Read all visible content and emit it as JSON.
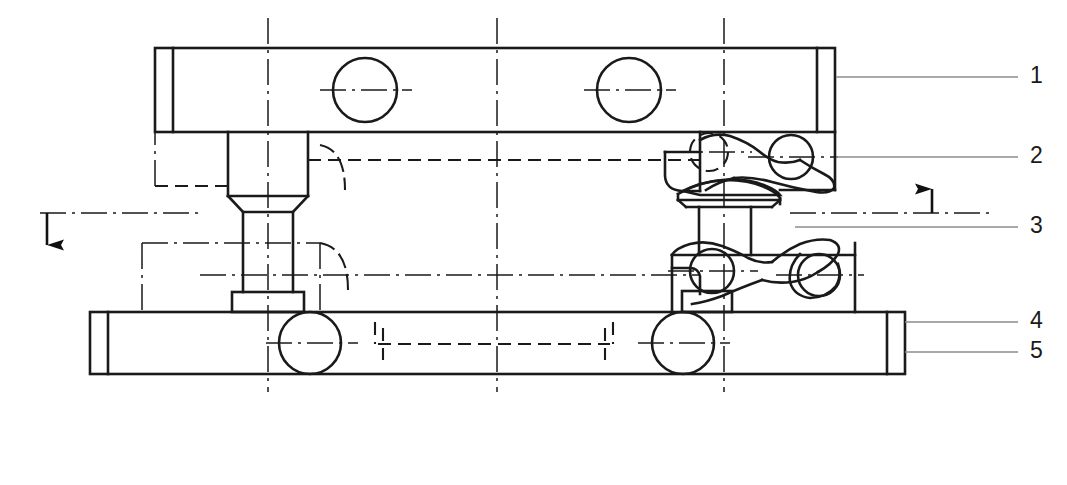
{
  "drawing": {
    "title": "Sectional assembly view of clamping fixture",
    "type": "engineering-line-drawing",
    "width": 1067,
    "height": 485,
    "background_color": "#ffffff",
    "line_color": "#1a1a1a",
    "leader_color": "#8c8c8c",
    "center_line_color": "#1a1a1a"
  },
  "callouts": [
    {
      "id": "1",
      "label": "1",
      "x": 1033,
      "y": 66,
      "leader_y": 77,
      "leader_x_start": 836,
      "leader_x_end": 1018
    },
    {
      "id": "2",
      "label": "2",
      "x": 1033,
      "y": 146,
      "leader_y": 157,
      "leader_x_start": 836,
      "leader_x_end": 1018
    },
    {
      "id": "3",
      "label": "3",
      "x": 1033,
      "y": 216,
      "leader_y": 227,
      "leader_x_start": 795,
      "leader_x_end": 1018
    },
    {
      "id": "4",
      "label": "4",
      "x": 1033,
      "y": 311,
      "leader_y": 322,
      "leader_x_start": 905,
      "leader_x_end": 1018
    },
    {
      "id": "5",
      "label": "5",
      "x": 1033,
      "y": 341,
      "leader_y": 352,
      "leader_x_start": 905,
      "leader_x_end": 1018
    }
  ],
  "section_arrows": [
    {
      "name": "left-section-arrow",
      "direction": "down",
      "x": 47,
      "y_tail": 213,
      "y_head": 262
    },
    {
      "name": "right-section-arrow",
      "direction": "up",
      "x": 932,
      "y_tail": 213,
      "y_head": 172
    }
  ],
  "center_lines": {
    "vertical_x": [
      268,
      497,
      724
    ],
    "horizontal_y": [
      90,
      160,
      213,
      275,
      343
    ]
  },
  "parts": {
    "top_bar": {
      "x": 155,
      "y": 48,
      "w": 680,
      "h": 84,
      "end_face_w": 18
    },
    "bottom_bar": {
      "x": 90,
      "y": 312,
      "w": 815,
      "h": 62,
      "end_face_w": 18
    },
    "left_post": {
      "head_x": 228,
      "head_y": 132,
      "head_w": 80,
      "head_h": 68,
      "shaft_x": 243,
      "shaft_w": 50,
      "shaft_bottom": 292,
      "foot_x": 232,
      "foot_y": 292,
      "foot_w": 72,
      "foot_h": 18
    },
    "center_pin": {
      "x": 699,
      "y": 207,
      "w": 52,
      "h": 48
    }
  },
  "holes": [
    {
      "name": "top-bar-hole-left",
      "cx": 365,
      "cy": 90,
      "r": 32
    },
    {
      "name": "top-bar-hole-right",
      "cx": 629,
      "cy": 90,
      "r": 32
    },
    {
      "name": "bottom-bar-hole-left",
      "cx": 310,
      "cy": 343,
      "r": 31
    },
    {
      "name": "bottom-bar-hole-right",
      "cx": 683,
      "cy": 343,
      "r": 31
    },
    {
      "name": "upper-cam-pivot",
      "cx": 791,
      "cy": 157,
      "r": 22
    },
    {
      "name": "upper-cam-hidden-bore",
      "cx": 709,
      "cy": 152,
      "r": 19
    },
    {
      "name": "lower-cam-pivot-left",
      "cx": 712,
      "cy": 271,
      "r": 22
    },
    {
      "name": "lower-cam-pivot-right",
      "cx": 819,
      "cy": 275,
      "r": 21
    }
  ]
}
